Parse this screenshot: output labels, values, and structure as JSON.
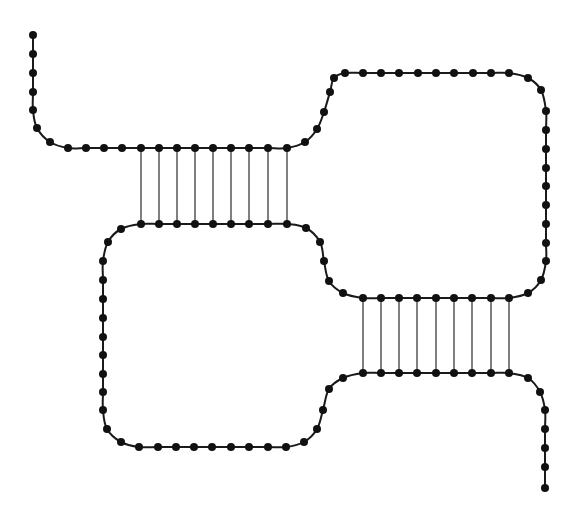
{
  "diagram": {
    "type": "nucleic-acid-secondary-structure",
    "colors": {
      "strand": "#1a1a1a",
      "node": "#111111",
      "rung": "#2a2a2a",
      "background": "#ffffff"
    },
    "strand_points": [
      [
        33,
        35
      ],
      [
        33,
        54
      ],
      [
        33,
        73
      ],
      [
        33,
        92
      ],
      [
        33,
        110
      ],
      [
        37,
        128
      ],
      [
        50,
        142
      ],
      [
        68,
        148
      ],
      [
        86,
        148
      ],
      [
        104,
        148
      ],
      [
        122,
        148
      ],
      [
        141,
        148
      ],
      [
        159,
        148
      ],
      [
        177,
        148
      ],
      [
        195,
        148
      ],
      [
        213,
        148
      ],
      [
        231,
        148
      ],
      [
        249,
        148
      ],
      [
        268,
        148
      ],
      [
        287,
        148
      ],
      [
        305,
        142
      ],
      [
        317,
        129
      ],
      [
        324,
        112
      ],
      [
        330,
        92
      ],
      [
        334,
        78
      ],
      [
        345,
        73
      ],
      [
        363,
        73
      ],
      [
        381,
        73
      ],
      [
        399,
        73
      ],
      [
        418,
        73
      ],
      [
        436,
        73
      ],
      [
        454,
        73
      ],
      [
        473,
        73
      ],
      [
        491,
        73
      ],
      [
        509,
        73
      ],
      [
        528,
        78
      ],
      [
        541,
        90
      ],
      [
        546,
        111
      ],
      [
        546,
        130
      ],
      [
        546,
        149
      ],
      [
        546,
        168
      ],
      [
        546,
        186
      ],
      [
        546,
        205
      ],
      [
        546,
        224
      ],
      [
        546,
        243
      ],
      [
        546,
        261
      ],
      [
        541,
        280
      ],
      [
        528,
        293
      ],
      [
        509,
        298
      ],
      [
        491,
        298
      ],
      [
        472,
        298
      ],
      [
        454,
        298
      ],
      [
        436,
        298
      ],
      [
        417,
        298
      ],
      [
        399,
        298
      ],
      [
        381,
        298
      ],
      [
        363,
        298
      ],
      [
        343,
        293
      ],
      [
        329,
        281
      ],
      [
        324,
        261
      ],
      [
        320,
        242
      ],
      [
        306,
        228
      ],
      [
        287,
        224
      ],
      [
        268,
        224
      ],
      [
        249,
        224
      ],
      [
        231,
        224
      ],
      [
        213,
        224
      ],
      [
        195,
        224
      ],
      [
        177,
        224
      ],
      [
        159,
        224
      ],
      [
        141,
        224
      ],
      [
        121,
        229
      ],
      [
        108,
        242
      ],
      [
        103,
        261
      ],
      [
        103,
        280
      ],
      [
        103,
        299
      ],
      [
        103,
        318
      ],
      [
        103,
        337
      ],
      [
        103,
        355
      ],
      [
        103,
        374
      ],
      [
        103,
        392
      ],
      [
        103,
        410
      ],
      [
        107,
        429
      ],
      [
        121,
        442
      ],
      [
        139,
        447
      ],
      [
        158,
        447
      ],
      [
        176,
        447
      ],
      [
        194,
        447
      ],
      [
        212,
        447
      ],
      [
        231,
        447
      ],
      [
        249,
        447
      ],
      [
        268,
        447
      ],
      [
        286,
        447
      ],
      [
        304,
        442
      ],
      [
        317,
        429
      ],
      [
        323,
        410
      ],
      [
        329,
        389
      ],
      [
        343,
        378
      ],
      [
        363,
        373
      ],
      [
        381,
        373
      ],
      [
        399,
        373
      ],
      [
        417,
        373
      ],
      [
        436,
        373
      ],
      [
        454,
        373
      ],
      [
        472,
        373
      ],
      [
        491,
        373
      ],
      [
        509,
        373
      ],
      [
        528,
        378
      ],
      [
        540,
        392
      ],
      [
        545,
        410
      ],
      [
        545,
        429
      ],
      [
        545,
        448
      ],
      [
        545,
        467
      ],
      [
        545,
        488
      ]
    ],
    "stems": [
      {
        "name": "stem-1",
        "pairs": 9,
        "x": [
          141,
          159,
          177,
          195,
          213,
          231,
          249,
          268,
          287
        ],
        "y_top": 148,
        "y_bottom": 224
      },
      {
        "name": "stem-2",
        "pairs": 9,
        "x": [
          363,
          381,
          399,
          417,
          436,
          454,
          472,
          491,
          509
        ],
        "y_top": 298,
        "y_bottom": 373
      }
    ],
    "node_radius": 4
  }
}
